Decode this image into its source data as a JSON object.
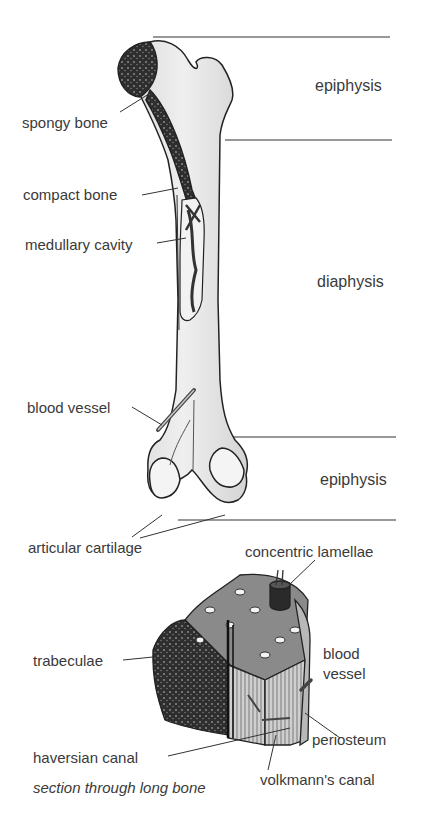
{
  "diagram": {
    "title": "section through long bone",
    "regions": [
      {
        "label": "epiphysis",
        "position": "top"
      },
      {
        "label": "diaphysis",
        "position": "middle"
      },
      {
        "label": "epiphysis",
        "position": "bottom"
      }
    ],
    "long_bone_labels": [
      "spongy bone",
      "compact bone",
      "medullary cavity",
      "blood vessel",
      "articular cartilage"
    ],
    "section_labels": {
      "concentric_lamellae": "concentric lamellae",
      "trabeculae": "trabeculae",
      "blood_vessel_line1": "blood",
      "blood_vessel_line2": "vessel",
      "periosteum": "periosteum",
      "haversian_canal": "haversian canal",
      "volkmanns_canal": "volkmann's canal"
    },
    "caption": "section through long bone",
    "colors": {
      "bone_fill": "#e6e6e6",
      "spongy_fill": "#3a3a3a",
      "outline": "#222222",
      "label_text": "#3a3a3a"
    }
  }
}
